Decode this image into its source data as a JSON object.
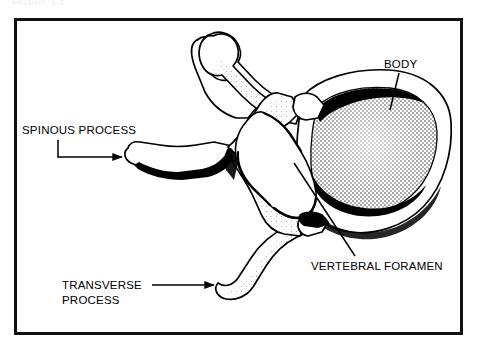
{
  "figure": {
    "caption": "FIGURE 1-1",
    "width": 477,
    "height": 351,
    "background_color": "#ffffff",
    "border_color": "#111111",
    "ink_color": "#000000"
  },
  "frame": {
    "x": 14,
    "y": 18,
    "width": 448,
    "height": 316
  },
  "labels": [
    {
      "id": "spinous-process",
      "text": "SPINOUS PROCESS",
      "lines": [
        "SPINOUS PROCESS"
      ],
      "x": 22,
      "y": 133,
      "anchor": "start",
      "leader": "M 58 140 L 58 157 L 124 157",
      "arrowhead": true,
      "arrow_point": [
        126,
        157
      ],
      "arrow_direction": "right"
    },
    {
      "id": "body",
      "text": "BODY",
      "lines": [
        "BODY"
      ],
      "x": 384,
      "y": 68,
      "anchor": "start",
      "leader": "M 399 73 L 390 110",
      "arrowhead": false,
      "arrow_point": null,
      "arrow_direction": null
    },
    {
      "id": "vertebral-foramen",
      "text": "VERTEBRAL FORAMEN",
      "lines": [
        "VERTEBRAL FORAMEN"
      ],
      "x": 311,
      "y": 269,
      "anchor": "start",
      "leader": "M 294 163 L 355 256",
      "arrowhead": false,
      "arrow_point": null,
      "arrow_direction": null
    },
    {
      "id": "transverse-process",
      "text": "TRANSVERSE PROCESS",
      "lines": [
        "TRANSVERSE",
        "PROCESS"
      ],
      "x": 62,
      "y": 289,
      "anchor": "start",
      "leader": "M 152 285 L 216 285",
      "arrowhead": true,
      "arrow_point": [
        219,
        285
      ],
      "arrow_direction": "right"
    }
  ],
  "anatomy": {
    "view": "superior",
    "specimen": "vertebra",
    "parts": [
      {
        "id": "vertebral-body",
        "name": "Body (centrum)",
        "shading": "stipple"
      },
      {
        "id": "vertebral-foramen-opening",
        "name": "Vertebral foramen",
        "shading": "none"
      },
      {
        "id": "spinous-process-shape",
        "name": "Spinous process",
        "shading": "dark-band"
      },
      {
        "id": "transverse-process-upper",
        "name": "Transverse process (superior-left)",
        "shading": "light"
      },
      {
        "id": "transverse-process-lower",
        "name": "Transverse process (inferior-left)",
        "shading": "light"
      },
      {
        "id": "pedicle-lamina",
        "name": "Pedicles and laminae",
        "shading": "light"
      },
      {
        "id": "articular-process",
        "name": "Superior articular process",
        "shading": "light"
      }
    ]
  }
}
